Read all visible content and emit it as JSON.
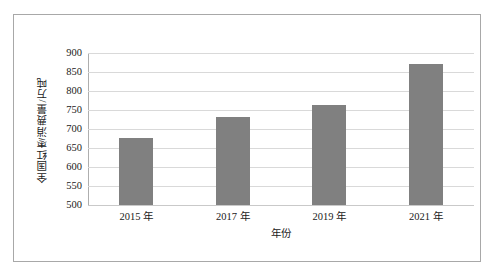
{
  "chart_data": {
    "type": "bar",
    "title": "",
    "subtitle": "",
    "categories": [
      "2015 年",
      "2017 年",
      "2019 年",
      "2021 年"
    ],
    "values": [
      677,
      731,
      762,
      871
    ],
    "xlabel": "年份",
    "ylabel": "全国红枣消费量/万吨",
    "ylim": [
      500,
      900
    ],
    "ytick_labels": [
      "900",
      "850",
      "800",
      "750",
      "700",
      "650",
      "600",
      "550",
      "500"
    ],
    "ytick_values": [
      900,
      850,
      800,
      750,
      700,
      650,
      600,
      550,
      500
    ],
    "grid": true,
    "legend": false,
    "legend_position": "none",
    "series": [
      {
        "name": "全国红枣消费量",
        "values": [
          677,
          731,
          762,
          871
        ]
      }
    ],
    "colors": {
      "bar": "#808080",
      "gridline": "#d9d9d9",
      "axis": "#aeaeae",
      "frame": "#a8a8a8",
      "background": "#ffffff",
      "text": "#1a1a1a"
    }
  }
}
